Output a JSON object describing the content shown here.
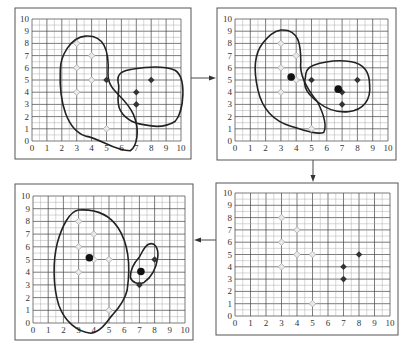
{
  "colors": {
    "light_point_fill": "#e8e8e8",
    "light_point_stroke": "#aaaaaa",
    "dark_point": "#333333",
    "centroid": "#111111",
    "grid": "#444444",
    "boundary": "#222222"
  },
  "axis": {
    "x_ticks": [
      "0",
      "1",
      "2",
      "3",
      "4",
      "5",
      "6",
      "7",
      "8",
      "9",
      "10"
    ],
    "y_ticks": [
      "0",
      "1",
      "2",
      "3",
      "4",
      "5",
      "6",
      "7",
      "8",
      "9",
      "10"
    ]
  },
  "panels": [
    {
      "id": "step-1-initial-assignment",
      "position": "top-left",
      "frame": [
        15,
        8,
        191,
        159
      ],
      "grid": [
        32,
        19,
        181,
        141
      ],
      "light_points": [
        [
          3,
          8
        ],
        [
          4,
          7
        ],
        [
          3,
          6
        ],
        [
          4,
          5
        ],
        [
          3,
          4
        ],
        [
          5,
          1
        ]
      ],
      "dark_points": [
        [
          5,
          5
        ],
        [
          7,
          4
        ],
        [
          7,
          3
        ],
        [
          8,
          5
        ]
      ],
      "centroids": [],
      "clusters": 2
    },
    {
      "id": "step-2-compute-centroids",
      "position": "top-right",
      "frame": [
        217,
        8,
        396,
        160
      ],
      "grid": [
        235,
        19,
        388,
        141
      ],
      "light_points": [
        [
          3,
          8
        ],
        [
          4,
          7
        ],
        [
          3,
          6
        ],
        [
          4,
          5
        ],
        [
          3,
          4
        ],
        [
          5,
          1
        ]
      ],
      "dark_points": [
        [
          5,
          5
        ],
        [
          7,
          4
        ],
        [
          7,
          3
        ],
        [
          8,
          5
        ]
      ],
      "centroids": [
        [
          3.67,
          5.25
        ],
        [
          6.75,
          4.25
        ]
      ],
      "clusters": 2
    },
    {
      "id": "step-3-reassign",
      "position": "bottom-right",
      "frame": [
        216,
        183,
        398,
        335
      ],
      "grid": [
        235,
        193,
        390,
        316
      ],
      "light_points": [
        [
          3,
          8
        ],
        [
          4,
          7
        ],
        [
          3,
          6
        ],
        [
          4,
          5
        ],
        [
          5,
          5
        ],
        [
          3,
          4
        ],
        [
          5,
          1
        ]
      ],
      "dark_points": [
        [
          7,
          4
        ],
        [
          7,
          3
        ],
        [
          8,
          5
        ]
      ],
      "centroids": [],
      "clusters": 0
    },
    {
      "id": "step-4-new-clusters",
      "position": "bottom-left",
      "frame": [
        15,
        184,
        193,
        340
      ],
      "grid": [
        33,
        196,
        185,
        323
      ],
      "light_points": [
        [
          3,
          8
        ],
        [
          4,
          7
        ],
        [
          3,
          6
        ],
        [
          4,
          5
        ],
        [
          5,
          5
        ],
        [
          3,
          4
        ],
        [
          5,
          1
        ]
      ],
      "dark_points": [
        [
          7,
          3
        ],
        [
          8,
          5
        ]
      ],
      "centroids": [
        [
          3.71,
          5.14
        ],
        [
          7.1,
          4.05
        ]
      ],
      "clusters": 2
    }
  ],
  "arrows": [
    {
      "from": "step-1-initial-assignment",
      "to": "step-2-compute-centroids",
      "direction": "right"
    },
    {
      "from": "step-2-compute-centroids",
      "to": "step-3-reassign",
      "direction": "down"
    },
    {
      "from": "step-3-reassign",
      "to": "step-4-new-clusters",
      "direction": "left"
    }
  ]
}
